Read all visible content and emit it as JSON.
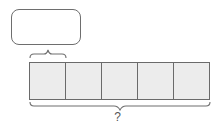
{
  "diagram": {
    "label_box": {
      "text": ""
    },
    "unit_brace": {
      "spans_cells": 1
    },
    "strip": {
      "cell_count": 5,
      "cells": [
        "",
        "",
        "",
        "",
        ""
      ],
      "fill_color": "#ececec",
      "border_color": "#6a6a6a"
    },
    "total_brace": {
      "label": "?"
    }
  }
}
